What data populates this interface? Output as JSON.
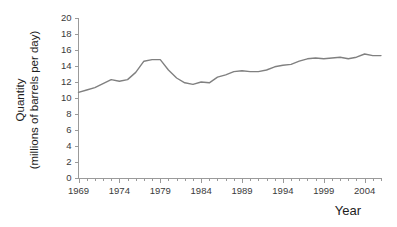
{
  "chart_data": {
    "type": "line",
    "title": "",
    "subtitle": "",
    "xlabel": "Year",
    "ylabel": "Quantity\n(millions of barrels per day)",
    "ylabel_line1": "Quantity",
    "ylabel_line2": "(millions of barrels per day)",
    "xlim": [
      1969,
      2006
    ],
    "ylim": [
      0,
      20
    ],
    "y_ticks": [
      0,
      2,
      4,
      6,
      8,
      10,
      12,
      14,
      16,
      18,
      20
    ],
    "y_tick_labels": [
      "0",
      "2",
      "4",
      "6",
      "8",
      "10",
      "12",
      "14",
      "16",
      "18",
      "20"
    ],
    "x_ticks_major": [
      1969,
      1974,
      1979,
      1984,
      1989,
      1994,
      1999,
      2004
    ],
    "x_tick_labels": [
      "1969",
      "1974",
      "1979",
      "1984",
      "1989",
      "1994",
      "1999",
      "2004"
    ],
    "x_minor_tick_interval": 1,
    "grid": false,
    "legend": false,
    "legend_position": "none",
    "line_color": "#808080",
    "axis_color": "#9a9a9a",
    "text_color": "#1d1d1d",
    "background_color": "#ffffff",
    "series": [
      {
        "name": "Quantity",
        "x": [
          1969,
          1970,
          1971,
          1972,
          1973,
          1974,
          1975,
          1976,
          1977,
          1978,
          1979,
          1980,
          1981,
          1982,
          1983,
          1984,
          1985,
          1986,
          1987,
          1988,
          1989,
          1990,
          1991,
          1992,
          1993,
          1994,
          1995,
          1996,
          1997,
          1998,
          1999,
          2000,
          2001,
          2002,
          2003,
          2004,
          2005,
          2006
        ],
        "values": [
          10.7,
          11.0,
          11.3,
          11.8,
          12.3,
          12.1,
          12.3,
          13.2,
          14.6,
          14.8,
          14.8,
          13.5,
          12.5,
          11.9,
          11.7,
          12.0,
          11.9,
          12.6,
          12.9,
          13.3,
          13.4,
          13.3,
          13.3,
          13.5,
          13.9,
          14.1,
          14.2,
          14.6,
          14.9,
          15.0,
          14.9,
          15.0,
          15.1,
          14.9,
          15.1,
          15.5,
          15.3,
          15.3
        ]
      }
    ]
  },
  "figure": {
    "xaxis_title": "Year",
    "yaxis_title_line1": "Quantity",
    "yaxis_title_line2": "(millions of barrels per day)"
  }
}
